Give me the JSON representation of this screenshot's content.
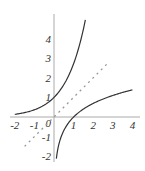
{
  "chart_data": {
    "type": "line",
    "title": "",
    "xlabel": "",
    "ylabel": "",
    "xlim": [
      -2,
      4
    ],
    "ylim": [
      -2,
      5
    ],
    "grid": false,
    "legend": null,
    "x_ticks": [
      "-2",
      "-1",
      "0",
      "1",
      "2",
      "3",
      "4"
    ],
    "y_ticks": [
      "-2",
      "-1",
      "1",
      "2",
      "3",
      "4"
    ],
    "series": [
      {
        "name": "y = e^x",
        "style": "solid",
        "color": "#333333",
        "domain": [
          -2,
          1.6
        ]
      },
      {
        "name": "y = ln(x)",
        "style": "solid",
        "color": "#333333",
        "domain": [
          0.12,
          4
        ]
      },
      {
        "name": "y = x",
        "style": "dashed",
        "color": "#999999",
        "domain": [
          -1.5,
          2.8
        ]
      }
    ]
  },
  "axes": {
    "x_labels": [
      "-2",
      "-1",
      "1",
      "2",
      "3",
      "4"
    ],
    "y_labels": [
      "4",
      "3",
      "2",
      "1",
      "-1",
      "-2"
    ],
    "origin_label": "0"
  }
}
